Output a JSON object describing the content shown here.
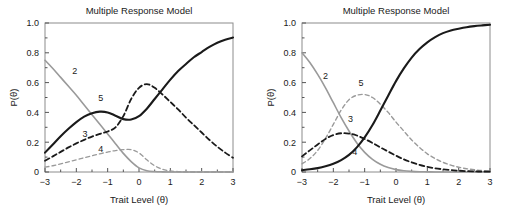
{
  "figure": {
    "panels": [
      {
        "id": "left-panel",
        "title": "Multiple Response Model",
        "xlabel": "Trait Level (θ)",
        "ylabel": "P(θ)",
        "xticks": [
          "−3",
          "−2",
          "−1",
          "0",
          "1",
          "2",
          "3"
        ],
        "yticks": [
          "0",
          "0.2",
          "0.4",
          "0.6",
          "0.8",
          "1.0"
        ],
        "curve_labels": [
          {
            "text": "2",
            "x": -2.05,
            "y": 0.655
          },
          {
            "text": "5",
            "x": -1.22,
            "y": 0.475
          },
          {
            "text": "3",
            "x": -1.72,
            "y": 0.235
          },
          {
            "text": "4",
            "x": -1.22,
            "y": 0.135
          }
        ]
      },
      {
        "id": "right-panel",
        "title": "Multiple Response Model",
        "xlabel": "Trait Level (θ)",
        "ylabel": "P(θ)",
        "xticks": [
          "−3",
          "−2",
          "−1",
          "0",
          "1",
          "2",
          "3"
        ],
        "yticks": [
          "0",
          "0.2",
          "0.4",
          "0.6",
          "0.8",
          "1.0"
        ],
        "curve_labels": [
          {
            "text": "2",
            "x": -2.25,
            "y": 0.625
          },
          {
            "text": "5",
            "x": -1.12,
            "y": 0.575
          },
          {
            "text": "3",
            "x": -1.45,
            "y": 0.335
          },
          {
            "text": "4",
            "x": -1.32,
            "y": 0.115
          }
        ]
      }
    ]
  },
  "chart_data": [
    {
      "type": "line",
      "panel": "left-panel",
      "title": "Multiple Response Model",
      "xlabel": "Trait Level (θ)",
      "ylabel": "P(θ)",
      "xlim": [
        -3,
        3
      ],
      "ylim": [
        0,
        1
      ],
      "xticks": [
        -3,
        -2,
        -1,
        0,
        1,
        2,
        3
      ],
      "yticks": [
        0,
        0.2,
        0.4,
        0.6,
        0.8,
        1.0
      ],
      "grid": false,
      "legend": "inline-curve-labels",
      "x": [
        -3,
        -2.75,
        -2.5,
        -2.25,
        -2,
        -1.75,
        -1.5,
        -1.25,
        -1,
        -0.75,
        -0.5,
        -0.25,
        0,
        0.25,
        0.5,
        0.75,
        1,
        1.25,
        1.5,
        1.75,
        2,
        2.25,
        2.5,
        2.75,
        3
      ],
      "series": [
        {
          "name": "2",
          "style": "solid",
          "color": "#9a9a9a",
          "width": 1.6,
          "values": [
            0.75,
            0.695,
            0.635,
            0.575,
            0.515,
            0.45,
            0.385,
            0.32,
            0.255,
            0.19,
            0.125,
            0.07,
            0.028,
            0.009,
            0.003,
            0.001,
            0.0,
            0.0,
            0.0,
            0.0,
            0.0,
            0.0,
            0.0,
            0.0,
            0.0
          ]
        },
        {
          "name": "4",
          "style": "dashed",
          "color": "#9a9a9a",
          "width": 1.3,
          "values": [
            0.032,
            0.042,
            0.054,
            0.068,
            0.082,
            0.096,
            0.109,
            0.122,
            0.134,
            0.144,
            0.15,
            0.15,
            0.128,
            0.082,
            0.042,
            0.018,
            0.007,
            0.003,
            0.001,
            0.0,
            0.0,
            0.0,
            0.0,
            0.0,
            0.0
          ]
        },
        {
          "name": "3",
          "style": "dashed",
          "color": "#1a1a1a",
          "width": 1.8,
          "values": [
            0.075,
            0.105,
            0.135,
            0.165,
            0.192,
            0.216,
            0.238,
            0.256,
            0.272,
            0.3,
            0.375,
            0.49,
            0.565,
            0.59,
            0.565,
            0.52,
            0.47,
            0.42,
            0.365,
            0.315,
            0.265,
            0.215,
            0.17,
            0.13,
            0.095
          ]
        },
        {
          "name": "5",
          "style": "solid",
          "color": "#1a1a1a",
          "width": 2.1,
          "values": [
            0.13,
            0.185,
            0.24,
            0.29,
            0.335,
            0.372,
            0.395,
            0.405,
            0.4,
            0.378,
            0.355,
            0.352,
            0.375,
            0.425,
            0.49,
            0.555,
            0.62,
            0.678,
            0.725,
            0.77,
            0.805,
            0.84,
            0.868,
            0.888,
            0.902
          ]
        }
      ]
    },
    {
      "type": "line",
      "panel": "right-panel",
      "title": "Multiple Response Model",
      "xlabel": "Trait Level (θ)",
      "ylabel": "P(θ)",
      "xlim": [
        -3,
        3
      ],
      "ylim": [
        0,
        1
      ],
      "xticks": [
        -3,
        -2,
        -1,
        0,
        1,
        2,
        3
      ],
      "yticks": [
        0,
        0.2,
        0.4,
        0.6,
        0.8,
        1.0
      ],
      "grid": false,
      "legend": "inline-curve-labels",
      "x": [
        -3,
        -2.75,
        -2.5,
        -2.25,
        -2,
        -1.75,
        -1.5,
        -1.25,
        -1,
        -0.75,
        -0.5,
        -0.25,
        0,
        0.25,
        0.5,
        0.75,
        1,
        1.25,
        1.5,
        1.75,
        2,
        2.25,
        2.5,
        2.75,
        3
      ],
      "series": [
        {
          "name": "2",
          "style": "solid",
          "color": "#9a9a9a",
          "width": 1.6,
          "values": [
            0.8,
            0.735,
            0.655,
            0.565,
            0.465,
            0.365,
            0.275,
            0.195,
            0.132,
            0.085,
            0.052,
            0.03,
            0.016,
            0.008,
            0.004,
            0.002,
            0.001,
            0.0,
            0.0,
            0.0,
            0.0,
            0.0,
            0.0,
            0.0,
            0.0
          ]
        },
        {
          "name": "5",
          "style": "dashed",
          "color": "#9a9a9a",
          "width": 1.4,
          "values": [
            0.055,
            0.09,
            0.145,
            0.225,
            0.32,
            0.415,
            0.485,
            0.515,
            0.52,
            0.5,
            0.455,
            0.4,
            0.335,
            0.275,
            0.215,
            0.165,
            0.122,
            0.09,
            0.065,
            0.046,
            0.032,
            0.022,
            0.015,
            0.01,
            0.007
          ]
        },
        {
          "name": "3",
          "style": "dashed",
          "color": "#1a1a1a",
          "width": 1.8,
          "values": [
            0.105,
            0.145,
            0.185,
            0.222,
            0.248,
            0.26,
            0.258,
            0.245,
            0.222,
            0.195,
            0.165,
            0.137,
            0.11,
            0.085,
            0.065,
            0.048,
            0.035,
            0.025,
            0.018,
            0.013,
            0.009,
            0.006,
            0.004,
            0.003,
            0.002
          ]
        },
        {
          "name": "4",
          "style": "solid",
          "color": "#1a1a1a",
          "width": 2.1,
          "values": [
            0.012,
            0.018,
            0.026,
            0.038,
            0.055,
            0.08,
            0.115,
            0.165,
            0.232,
            0.315,
            0.412,
            0.512,
            0.61,
            0.695,
            0.768,
            0.825,
            0.87,
            0.905,
            0.932,
            0.95,
            0.962,
            0.972,
            0.979,
            0.984,
            0.988
          ]
        }
      ]
    }
  ]
}
